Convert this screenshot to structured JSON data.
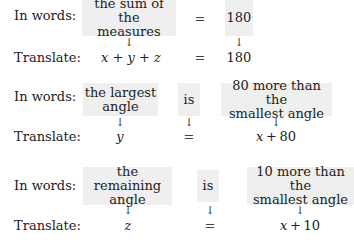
{
  "blocks": [
    {
      "words_label": "In words:",
      "translate_label": "Translate:",
      "phrases": [
        "the sum of the\nmeasures",
        "=",
        "180"
      ],
      "translation": {
        "left": "x + y + z",
        "relation": "=",
        "right": "180"
      },
      "arrow": "↓"
    },
    {
      "words_label": "In words:",
      "translate_label": "Translate:",
      "phrases": [
        "the largest\nangle",
        "is",
        "80 more than the\nsmallest angle"
      ],
      "translation": {
        "left": "y",
        "relation": "=",
        "right": "x + 80"
      },
      "arrow": "↓"
    },
    {
      "words_label": "In words:",
      "translate_label": "Translate:",
      "phrases": [
        "the remaining\nangle",
        "is",
        "10 more than the\nsmallest angle"
      ],
      "translation": {
        "left": "z",
        "relation": "=",
        "right": "x + 10"
      },
      "arrow": "↓"
    }
  ],
  "colors": {
    "box_fill": "#efefef",
    "text": "#222222"
  }
}
